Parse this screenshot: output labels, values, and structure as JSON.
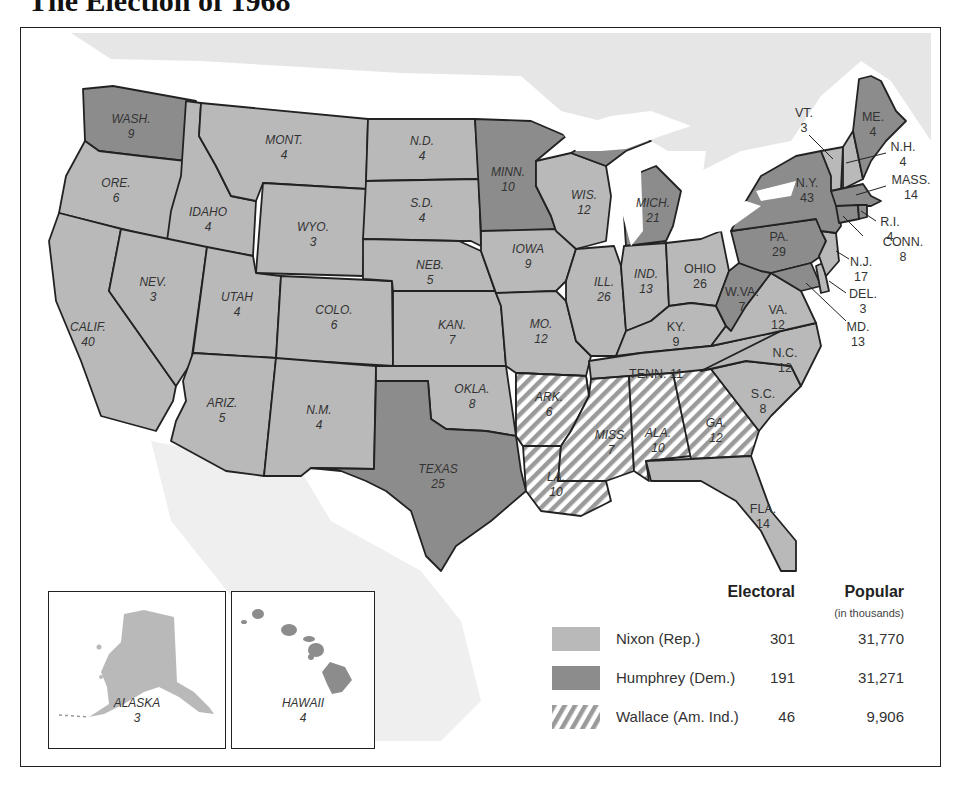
{
  "title": "The Election of 1968",
  "colors": {
    "nixon": "#b9b9b9",
    "humphrey": "#8c8c8c",
    "wallace_stripe": "#9a9a9a",
    "canada": "#e6e6e6",
    "border": "#222222"
  },
  "legend": {
    "electoral_header": "Electoral",
    "popular_header": "Popular",
    "popular_sub": "(in thousands)",
    "rows": [
      {
        "candidate": "Nixon (Rep.)",
        "electoral": "301",
        "popular": "31,770",
        "pattern": "nixon"
      },
      {
        "candidate": "Humphrey (Dem.)",
        "electoral": "191",
        "popular": "31,271",
        "pattern": "humphrey"
      },
      {
        "candidate": "Wallace (Am. Ind.)",
        "electoral": "46",
        "popular": "9,906",
        "pattern": "wallace"
      }
    ]
  },
  "insets": {
    "alaska": {
      "name": "ALASKA",
      "ev": "3",
      "winner": "nixon"
    },
    "hawaii": {
      "name": "HAWAII",
      "ev": "4",
      "winner": "humphrey"
    }
  },
  "states": {
    "wa": {
      "name": "WASH.",
      "ev": "9",
      "winner": "humphrey"
    },
    "or": {
      "name": "ORE.",
      "ev": "6",
      "winner": "nixon"
    },
    "ca": {
      "name": "CALIF.",
      "ev": "40",
      "winner": "nixon"
    },
    "id": {
      "name": "IDAHO",
      "ev": "4",
      "winner": "nixon"
    },
    "nv": {
      "name": "NEV.",
      "ev": "3",
      "winner": "nixon"
    },
    "mt": {
      "name": "MONT.",
      "ev": "4",
      "winner": "nixon"
    },
    "wy": {
      "name": "WYO.",
      "ev": "3",
      "winner": "nixon"
    },
    "ut": {
      "name": "UTAH",
      "ev": "4",
      "winner": "nixon"
    },
    "az": {
      "name": "ARIZ.",
      "ev": "5",
      "winner": "nixon"
    },
    "co": {
      "name": "COLO.",
      "ev": "6",
      "winner": "nixon"
    },
    "nm": {
      "name": "N.M.",
      "ev": "4",
      "winner": "nixon"
    },
    "nd": {
      "name": "N.D.",
      "ev": "4",
      "winner": "nixon"
    },
    "sd": {
      "name": "S.D.",
      "ev": "4",
      "winner": "nixon"
    },
    "ne": {
      "name": "NEB.",
      "ev": "5",
      "winner": "nixon"
    },
    "ks": {
      "name": "KAN.",
      "ev": "7",
      "winner": "nixon"
    },
    "ok": {
      "name": "OKLA.",
      "ev": "8",
      "winner": "nixon"
    },
    "tx": {
      "name": "TEXAS",
      "ev": "25",
      "winner": "humphrey"
    },
    "mn": {
      "name": "MINN.",
      "ev": "10",
      "winner": "humphrey"
    },
    "ia": {
      "name": "IOWA",
      "ev": "9",
      "winner": "nixon"
    },
    "mo": {
      "name": "MO.",
      "ev": "12",
      "winner": "nixon"
    },
    "ar": {
      "name": "ARK.",
      "ev": "6",
      "winner": "wallace"
    },
    "la": {
      "name": "LA.",
      "ev": "10",
      "winner": "wallace"
    },
    "wi": {
      "name": "WIS.",
      "ev": "12",
      "winner": "nixon"
    },
    "il": {
      "name": "ILL.",
      "ev": "26",
      "winner": "nixon"
    },
    "mi": {
      "name": "MICH.",
      "ev": "21",
      "winner": "humphrey"
    },
    "in": {
      "name": "IND.",
      "ev": "13",
      "winner": "nixon"
    },
    "oh": {
      "name": "OHIO",
      "ev": "26",
      "winner": "nixon"
    },
    "ky": {
      "name": "KY.",
      "ev": "9",
      "winner": "nixon"
    },
    "tn": {
      "name": "TENN. 11",
      "ev": "",
      "winner": "nixon"
    },
    "ms": {
      "name": "MISS.",
      "ev": "7",
      "winner": "wallace"
    },
    "al": {
      "name": "ALA.",
      "ev": "10",
      "winner": "wallace"
    },
    "ga": {
      "name": "GA.",
      "ev": "12",
      "winner": "wallace"
    },
    "fl": {
      "name": "FLA.",
      "ev": "14",
      "winner": "nixon"
    },
    "sc": {
      "name": "S.C.",
      "ev": "8",
      "winner": "nixon"
    },
    "nc": {
      "name": "N.C.",
      "ev": "12",
      "winner": "nixon"
    },
    "va": {
      "name": "VA.",
      "ev": "12",
      "winner": "nixon"
    },
    "wv": {
      "name": "W.VA.",
      "ev": "7",
      "winner": "humphrey"
    },
    "pa": {
      "name": "PA.",
      "ev": "29",
      "winner": "humphrey"
    },
    "ny": {
      "name": "N.Y.",
      "ev": "43",
      "winner": "humphrey"
    },
    "vt": {
      "name": "VT.",
      "ev": "3",
      "winner": "nixon"
    },
    "nh": {
      "name": "N.H.",
      "ev": "4",
      "winner": "nixon"
    },
    "me": {
      "name": "ME.",
      "ev": "4",
      "winner": "humphrey"
    },
    "ma": {
      "name": "MASS.",
      "ev": "14",
      "winner": "humphrey"
    },
    "ri": {
      "name": "R.I.",
      "ev": "4",
      "winner": "humphrey"
    },
    "ct": {
      "name": "CONN.",
      "ev": "8",
      "winner": "humphrey"
    },
    "nj": {
      "name": "N.J.",
      "ev": "17",
      "winner": "nixon"
    },
    "de": {
      "name": "DEL.",
      "ev": "3",
      "winner": "nixon"
    },
    "md": {
      "name": "MD.",
      "ev": "13",
      "winner": "humphrey"
    }
  }
}
